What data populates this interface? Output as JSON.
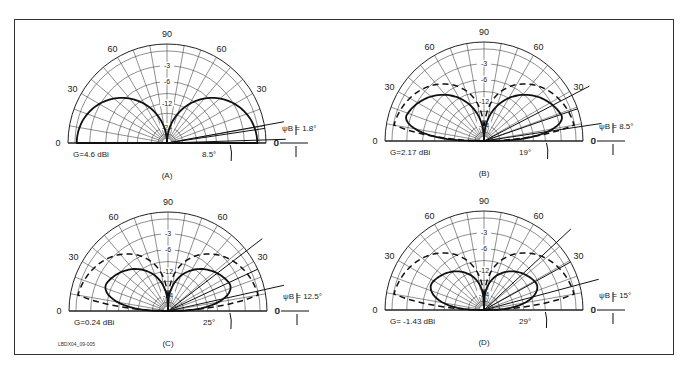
{
  "figure": {
    "code_label": "LBDX04_09-005",
    "frame_color": "#333333"
  },
  "chart_data": {
    "type": "polar-elevation-pattern",
    "angle_ticks": [
      0,
      30,
      60,
      90,
      60,
      30,
      0
    ],
    "db_rings": [
      "-3",
      "-6",
      "-12",
      "-24"
    ],
    "panels": [
      {
        "id": "A",
        "caption": "(A)",
        "gain": "G=4.6 dBi",
        "psi_label": "ψB = 1.8°",
        "takeoff_label": "8.5°",
        "cx": 167,
        "cy": 143,
        "r": 99,
        "takeoff_deg": 8.5,
        "beam_lower_deg": 1.8,
        "beam_upper_deg": 10.3,
        "lobe_peak": 0.93,
        "lobe_width": 1.0,
        "reference_dashed": false
      },
      {
        "id": "B",
        "caption": "(B)",
        "gain": "G=2.17 dBi",
        "psi_label": "ψB = 8.5°",
        "takeoff_label": "19°",
        "cx": 484,
        "cy": 141,
        "r": 99,
        "takeoff_deg": 19,
        "beam_lower_deg": 8.5,
        "beam_upper_deg": 27.5,
        "lobe_peak": 0.86,
        "lobe_width": 0.78,
        "reference_dashed": true
      },
      {
        "id": "C",
        "caption": "(C)",
        "gain": "G=0.24 dBi",
        "psi_label": "ψB = 12.5°",
        "takeoff_label": "25°",
        "cx": 168,
        "cy": 311,
        "r": 99,
        "takeoff_deg": 25,
        "beam_lower_deg": 12.5,
        "beam_upper_deg": 37.5,
        "lobe_peak": 0.72,
        "lobe_width": 0.6,
        "reference_dashed": true
      },
      {
        "id": "D",
        "caption": "(D)",
        "gain": "G= -1.43 dBi",
        "psi_label": "ψB = 15°",
        "takeoff_label": "29°",
        "cx": 484,
        "cy": 310,
        "r": 99,
        "takeoff_deg": 29,
        "beam_lower_deg": 15,
        "beam_upper_deg": 43,
        "lobe_peak": 0.63,
        "lobe_width": 0.5,
        "reference_dashed": true
      }
    ]
  }
}
